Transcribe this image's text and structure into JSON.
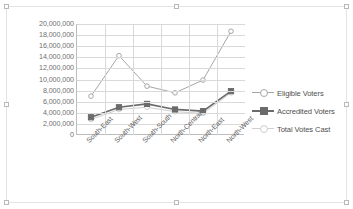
{
  "chart_data": {
    "type": "line",
    "title": "",
    "xlabel": "",
    "ylabel": "",
    "ylim": [
      0,
      20000000
    ],
    "ytick_step": 2000000,
    "grid": true,
    "legend_position": "right",
    "categories": [
      "South-East",
      "South-West",
      "South-South",
      "North-Central",
      "North-East",
      "North-West"
    ],
    "ytick_labels": [
      "20,000,000",
      "18,000,000",
      "16,000,000",
      "14,000,000",
      "12,000,000",
      "10,000,000",
      "8,000,000",
      "6,000,000",
      "4,000,000",
      "2,000,000",
      "0"
    ],
    "series": [
      {
        "name": "Eligible Voters",
        "color": "#a6a6a6",
        "marker": "circle",
        "values": [
          7000000,
          14300000,
          8800000,
          7600000,
          9900000,
          18700000
        ]
      },
      {
        "name": "Accredited Voters",
        "color": "#6b6b6b",
        "marker": "square",
        "values": [
          3200000,
          5000000,
          5600000,
          4600000,
          4300000,
          7900000
        ]
      },
      {
        "name": "Total Votes Cast",
        "color": "#cfcfcf",
        "marker": "circle",
        "values": [
          2800000,
          4600000,
          5000000,
          4200000,
          3900000,
          7600000
        ]
      }
    ]
  },
  "legend": {
    "items": [
      {
        "label": "Eligible Voters"
      },
      {
        "label": "Accredited Voters"
      },
      {
        "label": "Total Votes Cast"
      }
    ]
  }
}
